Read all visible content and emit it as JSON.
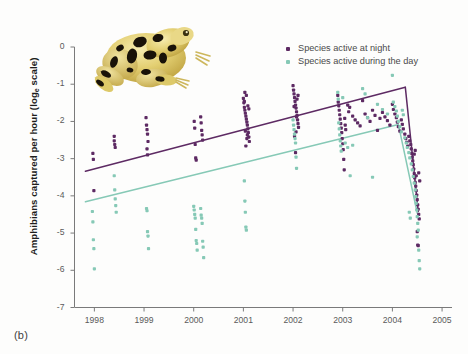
{
  "figure": {
    "panel_label": "(b)",
    "background_color": "#fdfdfc"
  },
  "legend": {
    "position": "top-right",
    "entries": [
      {
        "label": "Species active at night",
        "color": "#5d2a63",
        "marker": "square-dot"
      },
      {
        "label": "Species active during the day",
        "color": "#86c9b6",
        "marker": "square-dot"
      }
    ]
  },
  "illustration": {
    "name": "panamanian-golden-frog",
    "body_color": "#e6d37a",
    "highlight_color": "#f2e7a8",
    "spot_color": "#1a1408",
    "shadow_color": "#bda martin"
  },
  "axes": {
    "y_title_main": "Amphibians captured per hour (log",
    "y_title_sub": "e",
    "y_title_tail": " scale)",
    "y_ticks": [
      "0",
      "-1",
      "-2",
      "-3",
      "-4",
      "-5",
      "-6",
      "-7"
    ],
    "x_ticks": [
      "1998",
      "1999",
      "2000",
      "2001",
      "2002",
      "2003",
      "2004",
      "2005"
    ],
    "axis_color": "#7a7a7a",
    "tick_text_color": "#5a5a5a"
  },
  "chart_data": {
    "type": "scatter",
    "title": "",
    "xlabel": "",
    "ylabel": "Amphibians captured per hour (log_e scale)",
    "xlim": [
      1997.6,
      2005.2
    ],
    "ylim": [
      -7,
      0
    ],
    "grid": false,
    "legend_position": "upper right",
    "series": [
      {
        "name": "Species active at night",
        "color": "#5d2a63",
        "trend_line": {
          "color": "#5d2a63",
          "segments": [
            {
              "x": [
                1997.82,
                2004.26
              ],
              "y": [
                -3.34,
                -1.08
              ]
            },
            {
              "x": [
                2004.26,
                2004.52
              ],
              "y": [
                -1.08,
                -4.42
              ]
            }
          ]
        },
        "points": [
          [
            1997.97,
            -2.86
          ],
          [
            1997.98,
            -3.02
          ],
          [
            1997.99,
            -3.86
          ],
          [
            1998.4,
            -2.52
          ],
          [
            1998.41,
            -2.62
          ],
          [
            1998.42,
            -2.7
          ],
          [
            1998.4,
            -2.4
          ],
          [
            1999.04,
            -1.9
          ],
          [
            1999.05,
            -2.1
          ],
          [
            1999.06,
            -2.22
          ],
          [
            1999.07,
            -2.34
          ],
          [
            1999.08,
            -2.54
          ],
          [
            1999.06,
            -2.74
          ],
          [
            1999.07,
            -2.9
          ],
          [
            2000.01,
            -2.0
          ],
          [
            2000.02,
            -2.18
          ],
          [
            2000.03,
            -2.62
          ],
          [
            2000.04,
            -2.98
          ],
          [
            2000.05,
            -3.04
          ],
          [
            2000.14,
            -1.88
          ],
          [
            2000.15,
            -2.04
          ],
          [
            2000.16,
            -2.24
          ],
          [
            2000.17,
            -2.36
          ],
          [
            2000.18,
            -2.5
          ],
          [
            2001.0,
            -1.38
          ],
          [
            2001.01,
            -1.5
          ],
          [
            2001.02,
            -1.62
          ],
          [
            2001.03,
            -1.7
          ],
          [
            2001.04,
            -1.78
          ],
          [
            2001.05,
            -1.86
          ],
          [
            2001.06,
            -1.94
          ],
          [
            2001.07,
            -2.02
          ],
          [
            2001.08,
            -2.1
          ],
          [
            2001.09,
            -2.2
          ],
          [
            2001.1,
            -2.3
          ],
          [
            2001.11,
            -2.42
          ],
          [
            2001.12,
            -2.54
          ],
          [
            2001.05,
            -2.66
          ],
          [
            2001.06,
            -1.3
          ],
          [
            2001.03,
            -1.22
          ],
          [
            2001.08,
            -2.36
          ],
          [
            2001.02,
            -1.46
          ],
          [
            2001.09,
            -1.58
          ],
          [
            2001.11,
            -1.66
          ],
          [
            2001.04,
            -2.26
          ],
          [
            2001.07,
            -2.46
          ],
          [
            2002.0,
            -1.04
          ],
          [
            2002.01,
            -1.16
          ],
          [
            2002.02,
            -1.26
          ],
          [
            2002.03,
            -1.36
          ],
          [
            2002.04,
            -1.46
          ],
          [
            2002.05,
            -1.56
          ],
          [
            2002.06,
            -1.64
          ],
          [
            2002.07,
            -1.74
          ],
          [
            2002.08,
            -1.84
          ],
          [
            2002.09,
            -1.96
          ],
          [
            2002.1,
            -2.06
          ],
          [
            2002.11,
            -2.16
          ],
          [
            2002.06,
            -2.28
          ],
          [
            2002.03,
            -2.4
          ],
          [
            2002.08,
            -1.4
          ],
          [
            2002.02,
            -1.6
          ],
          [
            2002.1,
            -1.3
          ],
          [
            2002.05,
            -2.84
          ],
          [
            2002.07,
            -1.88
          ],
          [
            2002.9,
            -1.3
          ],
          [
            2002.91,
            -1.48
          ],
          [
            2002.92,
            -1.58
          ],
          [
            2002.93,
            -1.7
          ],
          [
            2002.94,
            -1.82
          ],
          [
            2002.95,
            -1.94
          ],
          [
            2002.96,
            -2.06
          ],
          [
            2002.97,
            -2.18
          ],
          [
            2002.98,
            -2.3
          ],
          [
            2002.99,
            -2.46
          ],
          [
            2003.0,
            -2.6
          ],
          [
            2003.01,
            -2.76
          ],
          [
            2003.02,
            -3.02
          ],
          [
            2003.03,
            -3.3
          ],
          [
            2003.04,
            -1.92
          ],
          [
            2003.05,
            -2.1
          ],
          [
            2003.06,
            -2.22
          ],
          [
            2003.1,
            -1.56
          ],
          [
            2003.12,
            -1.74
          ],
          [
            2003.14,
            -1.62
          ],
          [
            2003.2,
            -1.86
          ],
          [
            2003.25,
            -1.96
          ],
          [
            2003.3,
            -2.04
          ],
          [
            2003.35,
            -2.12
          ],
          [
            2003.4,
            -1.44
          ],
          [
            2003.45,
            -1.8
          ],
          [
            2003.5,
            -1.9
          ],
          [
            2003.55,
            -2.0
          ],
          [
            2003.6,
            -1.7
          ],
          [
            2003.65,
            -1.84
          ],
          [
            2003.7,
            -2.24
          ],
          [
            2003.75,
            -1.92
          ],
          [
            2003.8,
            -1.76
          ],
          [
            2003.85,
            -1.88
          ],
          [
            2003.9,
            -1.98
          ],
          [
            2003.95,
            -2.1
          ],
          [
            2004.0,
            -1.54
          ],
          [
            2004.02,
            -1.68
          ],
          [
            2004.05,
            -1.8
          ],
          [
            2004.08,
            -1.9
          ],
          [
            2004.1,
            -2.02
          ],
          [
            2004.12,
            -2.14
          ],
          [
            2004.15,
            -2.26
          ],
          [
            2004.18,
            -1.96
          ],
          [
            2004.2,
            -2.08
          ],
          [
            2004.22,
            -2.2
          ],
          [
            2004.25,
            -2.34
          ],
          [
            2004.27,
            -2.46
          ],
          [
            2004.29,
            -2.56
          ],
          [
            2004.31,
            -2.66
          ],
          [
            2004.33,
            -2.4
          ],
          [
            2004.35,
            -2.52
          ],
          [
            2004.37,
            -2.62
          ],
          [
            2004.38,
            -2.74
          ],
          [
            2004.39,
            -2.86
          ],
          [
            2004.4,
            -2.96
          ],
          [
            2004.41,
            -3.06
          ],
          [
            2004.42,
            -3.16
          ],
          [
            2004.43,
            -3.28
          ],
          [
            2004.44,
            -3.4
          ],
          [
            2004.45,
            -3.52
          ],
          [
            2004.46,
            -3.64
          ],
          [
            2004.47,
            -3.74
          ],
          [
            2004.48,
            -3.86
          ],
          [
            2004.49,
            -3.98
          ],
          [
            2004.5,
            -4.1
          ],
          [
            2004.51,
            -4.24
          ],
          [
            2004.52,
            -4.36
          ],
          [
            2004.53,
            -4.5
          ],
          [
            2004.54,
            -4.62
          ],
          [
            2004.5,
            -4.96
          ],
          [
            2004.51,
            -5.32
          ],
          [
            2004.52,
            -5.34
          ],
          [
            2004.46,
            -2.78
          ],
          [
            2004.44,
            -2.88
          ],
          [
            2004.48,
            -3.46
          ],
          [
            2004.53,
            -3.38
          ],
          [
            2004.55,
            -3.6
          ]
        ]
      },
      {
        "name": "Species active during the day",
        "color": "#86c9b6",
        "trend_line": {
          "color": "#86c9b6",
          "segments": [
            {
              "x": [
                1997.82,
                2004.12
              ],
              "y": [
                -4.16,
                -2.08
              ]
            },
            {
              "x": [
                2004.12,
                2004.5
              ],
              "y": [
                -2.08,
                -4.46
              ]
            }
          ]
        },
        "points": [
          [
            1997.96,
            -4.42
          ],
          [
            1997.97,
            -4.7
          ],
          [
            1997.98,
            -5.18
          ],
          [
            1997.99,
            -5.42
          ],
          [
            1998.0,
            -5.96
          ],
          [
            1998.4,
            -3.46
          ],
          [
            1998.41,
            -3.84
          ],
          [
            1998.42,
            -4.08
          ],
          [
            1998.43,
            -4.26
          ],
          [
            1998.44,
            -4.44
          ],
          [
            1999.05,
            -4.34
          ],
          [
            1999.06,
            -4.4
          ],
          [
            1999.07,
            -4.96
          ],
          [
            1999.08,
            -5.08
          ],
          [
            1999.09,
            -5.42
          ],
          [
            2000.0,
            -4.28
          ],
          [
            2000.01,
            -4.38
          ],
          [
            2000.02,
            -4.5
          ],
          [
            2000.03,
            -4.6
          ],
          [
            2000.04,
            -4.9
          ],
          [
            2000.05,
            -5.2
          ],
          [
            2000.06,
            -5.28
          ],
          [
            2000.07,
            -5.46
          ],
          [
            2000.14,
            -4.34
          ],
          [
            2000.15,
            -4.52
          ],
          [
            2000.16,
            -4.6
          ],
          [
            2000.17,
            -4.74
          ],
          [
            2000.18,
            -5.22
          ],
          [
            2000.19,
            -5.38
          ],
          [
            2000.2,
            -5.66
          ],
          [
            2001.02,
            -3.6
          ],
          [
            2001.03,
            -4.14
          ],
          [
            2001.04,
            -4.44
          ],
          [
            2001.05,
            -4.84
          ],
          [
            2001.06,
            -4.92
          ],
          [
            2002.0,
            -1.96
          ],
          [
            2002.01,
            -2.1
          ],
          [
            2002.02,
            -2.22
          ],
          [
            2002.03,
            -2.34
          ],
          [
            2002.04,
            -2.46
          ],
          [
            2002.05,
            -2.58
          ],
          [
            2002.06,
            -2.96
          ],
          [
            2002.07,
            -3.26
          ],
          [
            2002.9,
            -1.22
          ],
          [
            2002.91,
            -1.4
          ],
          [
            2002.92,
            -2.04
          ],
          [
            2002.93,
            -2.2
          ],
          [
            2002.94,
            -2.36
          ],
          [
            2002.95,
            -2.52
          ],
          [
            2002.96,
            -2.66
          ],
          [
            2002.97,
            -2.8
          ],
          [
            2003.0,
            -1.36
          ],
          [
            2003.05,
            -2.58
          ],
          [
            2003.1,
            -2.7
          ],
          [
            2003.15,
            -3.46
          ],
          [
            2003.2,
            -2.64
          ],
          [
            2003.4,
            -1.12
          ],
          [
            2003.45,
            -1.26
          ],
          [
            2003.5,
            -1.9
          ],
          [
            2003.6,
            -3.5
          ],
          [
            2003.7,
            -1.54
          ],
          [
            2003.8,
            -1.68
          ],
          [
            2003.9,
            -1.8
          ],
          [
            2004.0,
            -0.76
          ],
          [
            2004.02,
            -1.48
          ],
          [
            2004.05,
            -1.6
          ],
          [
            2004.08,
            -1.72
          ],
          [
            2004.1,
            -1.86
          ],
          [
            2004.12,
            -2.0
          ],
          [
            2004.15,
            -2.14
          ],
          [
            2004.18,
            -2.28
          ],
          [
            2004.2,
            -1.7
          ],
          [
            2004.22,
            -1.82
          ],
          [
            2004.25,
            -2.44
          ],
          [
            2004.28,
            -2.58
          ],
          [
            2004.3,
            -2.7
          ],
          [
            2004.33,
            -2.84
          ],
          [
            2004.35,
            -2.98
          ],
          [
            2004.38,
            -3.14
          ],
          [
            2004.4,
            -3.3
          ],
          [
            2004.42,
            -3.48
          ],
          [
            2004.44,
            -3.66
          ],
          [
            2004.46,
            -3.84
          ],
          [
            2004.47,
            -4.02
          ],
          [
            2004.48,
            -4.2
          ],
          [
            2004.49,
            -4.38
          ],
          [
            2004.5,
            -4.56
          ],
          [
            2004.51,
            -4.74
          ],
          [
            2004.52,
            -4.92
          ],
          [
            2004.5,
            -5.1
          ],
          [
            2004.53,
            -5.46
          ],
          [
            2004.54,
            -5.74
          ],
          [
            2004.55,
            -5.96
          ],
          [
            2004.36,
            -4.6
          ],
          [
            2004.34,
            -4.44
          ]
        ]
      }
    ]
  }
}
